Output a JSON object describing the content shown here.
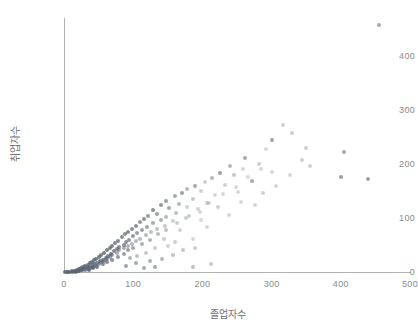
{
  "chart_data": {
    "type": "scatter",
    "title": "",
    "xlabel": "졸업자수",
    "ylabel": "취업자수",
    "xlim": [
      0,
      520
    ],
    "ylim": [
      0,
      480
    ],
    "grid": false,
    "legend": null,
    "xticks": [
      0,
      100,
      200,
      300,
      400,
      500
    ],
    "yticks": [
      0,
      100,
      200,
      300,
      400
    ],
    "xticklabels": [
      "0",
      "100",
      "200",
      "300",
      "400",
      "500"
    ],
    "yticklabels": [
      "0",
      "100",
      "200",
      "300",
      "400"
    ],
    "marker": {
      "color": "#5a6472",
      "opacity_range": [
        0.18,
        0.85
      ],
      "size_px": 4
    },
    "series": [
      {
        "name": "대학별 졸업자수 대비 취업자수",
        "points": [
          [
            455,
            458,
            0.55
          ],
          [
            316,
            272,
            0.3
          ],
          [
            330,
            258,
            0.3
          ],
          [
            300,
            244,
            0.6
          ],
          [
            292,
            228,
            0.25
          ],
          [
            350,
            230,
            0.3
          ],
          [
            404,
            222,
            0.55
          ],
          [
            262,
            212,
            0.55
          ],
          [
            344,
            208,
            0.3
          ],
          [
            282,
            200,
            0.3
          ],
          [
            240,
            196,
            0.45
          ],
          [
            258,
            190,
            0.25
          ],
          [
            300,
            186,
            0.25
          ],
          [
            226,
            184,
            0.6
          ],
          [
            246,
            180,
            0.35
          ],
          [
            400,
            176,
            0.6
          ],
          [
            440,
            172,
            0.6
          ],
          [
            214,
            174,
            0.45
          ],
          [
            272,
            168,
            0.55
          ],
          [
            204,
            166,
            0.3
          ],
          [
            232,
            162,
            0.3
          ],
          [
            190,
            160,
            0.55
          ],
          [
            178,
            154,
            0.45
          ],
          [
            198,
            150,
            0.3
          ],
          [
            252,
            148,
            0.25
          ],
          [
            288,
            146,
            0.3
          ],
          [
            170,
            146,
            0.6
          ],
          [
            218,
            142,
            0.25
          ],
          [
            160,
            140,
            0.55
          ],
          [
            186,
            136,
            0.35
          ],
          [
            148,
            132,
            0.6
          ],
          [
            206,
            128,
            0.3
          ],
          [
            166,
            126,
            0.45
          ],
          [
            140,
            124,
            0.65
          ],
          [
            178,
            120,
            0.3
          ],
          [
            152,
            118,
            0.55
          ],
          [
            128,
            114,
            0.7
          ],
          [
            196,
            112,
            0.25
          ],
          [
            162,
            110,
            0.4
          ],
          [
            134,
            108,
            0.6
          ],
          [
            122,
            104,
            0.65
          ],
          [
            148,
            102,
            0.45
          ],
          [
            176,
            100,
            0.3
          ],
          [
            116,
            98,
            0.7
          ],
          [
            140,
            96,
            0.5
          ],
          [
            158,
            94,
            0.3
          ],
          [
            110,
            92,
            0.65
          ],
          [
            128,
            90,
            0.55
          ],
          [
            104,
            86,
            0.7
          ],
          [
            146,
            86,
            0.35
          ],
          [
            120,
            84,
            0.6
          ],
          [
            98,
            80,
            0.7
          ],
          [
            134,
            80,
            0.4
          ],
          [
            112,
            78,
            0.6
          ],
          [
            92,
            74,
            0.72
          ],
          [
            126,
            74,
            0.4
          ],
          [
            106,
            72,
            0.62
          ],
          [
            88,
            70,
            0.72
          ],
          [
            118,
            68,
            0.45
          ],
          [
            100,
            66,
            0.65
          ],
          [
            84,
            64,
            0.72
          ],
          [
            110,
            62,
            0.45
          ],
          [
            94,
            60,
            0.68
          ],
          [
            78,
            58,
            0.75
          ],
          [
            104,
            58,
            0.45
          ],
          [
            90,
            56,
            0.68
          ],
          [
            74,
            54,
            0.75
          ],
          [
            98,
            52,
            0.48
          ],
          [
            86,
            50,
            0.7
          ],
          [
            70,
            48,
            0.75
          ],
          [
            92,
            48,
            0.5
          ],
          [
            80,
            46,
            0.72
          ],
          [
            66,
            44,
            0.78
          ],
          [
            86,
            44,
            0.52
          ],
          [
            76,
            42,
            0.72
          ],
          [
            62,
            40,
            0.78
          ],
          [
            80,
            40,
            0.55
          ],
          [
            72,
            38,
            0.74
          ],
          [
            58,
            36,
            0.8
          ],
          [
            76,
            36,
            0.55
          ],
          [
            68,
            34,
            0.76
          ],
          [
            54,
            32,
            0.8
          ],
          [
            70,
            32,
            0.58
          ],
          [
            64,
            30,
            0.78
          ],
          [
            50,
            28,
            0.82
          ],
          [
            66,
            28,
            0.6
          ],
          [
            60,
            26,
            0.78
          ],
          [
            46,
            25,
            0.82
          ],
          [
            62,
            24,
            0.6
          ],
          [
            56,
            23,
            0.8
          ],
          [
            43,
            22,
            0.82
          ],
          [
            58,
            21,
            0.62
          ],
          [
            52,
            20,
            0.8
          ],
          [
            40,
            19,
            0.84
          ],
          [
            54,
            18,
            0.64
          ],
          [
            48,
            17,
            0.8
          ],
          [
            37,
            16,
            0.84
          ],
          [
            50,
            15,
            0.66
          ],
          [
            44,
            14,
            0.82
          ],
          [
            34,
            13,
            0.84
          ],
          [
            46,
            12,
            0.68
          ],
          [
            40,
            12,
            0.82
          ],
          [
            31,
            11,
            0.85
          ],
          [
            42,
            10,
            0.7
          ],
          [
            36,
            9,
            0.82
          ],
          [
            28,
            9,
            0.85
          ],
          [
            38,
            8,
            0.72
          ],
          [
            32,
            7,
            0.84
          ],
          [
            25,
            7,
            0.85
          ],
          [
            34,
            6,
            0.74
          ],
          [
            28,
            5,
            0.84
          ],
          [
            22,
            5,
            0.85
          ],
          [
            30,
            4,
            0.76
          ],
          [
            24,
            4,
            0.84
          ],
          [
            19,
            3,
            0.85
          ],
          [
            26,
            3,
            0.78
          ],
          [
            20,
            2,
            0.84
          ],
          [
            16,
            2,
            0.85
          ],
          [
            22,
            1,
            0.8
          ],
          [
            16,
            1,
            0.84
          ],
          [
            12,
            1,
            0.85
          ],
          [
            18,
            0,
            0.8
          ],
          [
            13,
            0,
            0.84
          ],
          [
            9,
            0,
            0.85
          ],
          [
            6,
            0,
            0.85
          ],
          [
            4,
            0,
            0.85
          ],
          [
            2,
            0,
            0.85
          ],
          [
            160,
            56,
            0.3
          ],
          [
            186,
            62,
            0.25
          ],
          [
            150,
            48,
            0.28
          ],
          [
            132,
            44,
            0.3
          ],
          [
            206,
            84,
            0.25
          ],
          [
            238,
            106,
            0.28
          ],
          [
            118,
            36,
            0.35
          ],
          [
            106,
            30,
            0.4
          ],
          [
            96,
            26,
            0.45
          ],
          [
            144,
            62,
            0.32
          ],
          [
            168,
            78,
            0.28
          ],
          [
            198,
            96,
            0.25
          ],
          [
            222,
            120,
            0.3
          ],
          [
            256,
            130,
            0.25
          ],
          [
            276,
            124,
            0.28
          ],
          [
            306,
            160,
            0.25
          ],
          [
            326,
            180,
            0.25
          ],
          [
            356,
            196,
            0.3
          ],
          [
            132,
            10,
            0.55
          ],
          [
            116,
            8,
            0.55
          ],
          [
            186,
            10,
            0.4
          ],
          [
            212,
            14,
            0.35
          ],
          [
            90,
            12,
            0.6
          ],
          [
            104,
            16,
            0.55
          ],
          [
            142,
            24,
            0.45
          ],
          [
            124,
            20,
            0.5
          ],
          [
            158,
            32,
            0.4
          ],
          [
            172,
            40,
            0.35
          ],
          [
            190,
            44,
            0.32
          ],
          [
            86,
            34,
            0.62
          ],
          [
            78,
            28,
            0.66
          ],
          [
            70,
            22,
            0.7
          ],
          [
            62,
            18,
            0.72
          ],
          [
            56,
            14,
            0.74
          ],
          [
            48,
            10,
            0.78
          ],
          [
            42,
            7,
            0.8
          ],
          [
            36,
            4,
            0.82
          ],
          [
            100,
            44,
            0.58
          ],
          [
            92,
            40,
            0.62
          ],
          [
            112,
            52,
            0.52
          ],
          [
            124,
            60,
            0.48
          ],
          [
            136,
            70,
            0.42
          ],
          [
            148,
            78,
            0.38
          ],
          [
            164,
            90,
            0.32
          ],
          [
            180,
            104,
            0.3
          ],
          [
            194,
            116,
            0.28
          ],
          [
            210,
            128,
            0.26
          ],
          [
            230,
            144,
            0.26
          ],
          [
            248,
            158,
            0.26
          ],
          [
            266,
            176,
            0.25
          ],
          [
            284,
            190,
            0.25
          ]
        ]
      }
    ]
  }
}
